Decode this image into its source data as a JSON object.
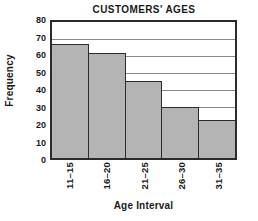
{
  "chart_data": {
    "type": "bar",
    "title": "CUSTOMERS' AGES",
    "xlabel": "Age Interval",
    "ylabel": "Frequency",
    "categories": [
      "11–15",
      "16–20",
      "21–25",
      "26–30",
      "31–35"
    ],
    "values": [
      65,
      60,
      44,
      29,
      22
    ],
    "ylim": [
      0,
      80
    ],
    "ytick_values": [
      0,
      10,
      20,
      30,
      40,
      50,
      60,
      70,
      80
    ],
    "ytick_labels": [
      "0",
      "10",
      "20",
      "30",
      "40",
      "50",
      "60",
      "70",
      "80"
    ],
    "grid": true,
    "grid_axis": "y",
    "legend": false,
    "bar_fill_color": "#b4b4b4",
    "bar_edge_color": "#2b2b2b",
    "axis_color": "#2b2b2b",
    "gridline_color": "#8a8a8a",
    "background_color": "#ffffff",
    "text_color": "#1a1a1a",
    "bar_gap": 0
  }
}
